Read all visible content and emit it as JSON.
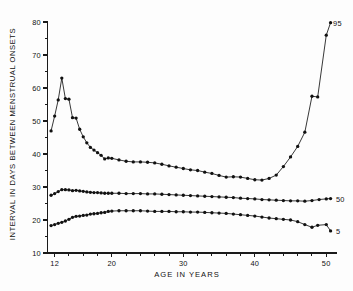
{
  "chart_data": {
    "type": "line",
    "title": "",
    "xlabel": "AGE IN YEARS",
    "ylabel": "INTERVAL IN DAYS BETWEEN MENSTRUAL ONSETS",
    "xlim": [
      11,
      51.5
    ],
    "ylim": [
      10,
      80
    ],
    "grid": false,
    "legend_position": "right-inline",
    "x_ticks_major": [
      12,
      20,
      30,
      40,
      50
    ],
    "x_ticks_major_labels": [
      "12",
      "20",
      "30",
      "40",
      "50"
    ],
    "x_ticks_minor": [
      14,
      16,
      18,
      22,
      24,
      26,
      28,
      32,
      34,
      36,
      38,
      42,
      44,
      46,
      48
    ],
    "y_ticks_major": [
      10,
      20,
      30,
      40,
      50,
      60,
      70,
      80
    ],
    "y_ticks_major_labels": [
      "10",
      "20",
      "30",
      "40",
      "50",
      "60",
      "70",
      "80"
    ],
    "y_ticks_minor": [
      15,
      25,
      35,
      45,
      55,
      65,
      75
    ],
    "series": [
      {
        "name": "95",
        "label": "95",
        "label_x": 50.6,
        "label_y": 79.6,
        "x": [
          11.5,
          12.0,
          12.5,
          13.0,
          13.5,
          14.0,
          14.5,
          15.0,
          15.5,
          16.0,
          16.5,
          17.0,
          17.5,
          18.0,
          18.5,
          19.0,
          19.5,
          20.0,
          21.0,
          22.0,
          23.0,
          24.0,
          25.0,
          26.0,
          27.0,
          28.0,
          29.0,
          30.0,
          31.0,
          32.0,
          33.0,
          34.0,
          35.0,
          36.0,
          37.0,
          38.0,
          39.0,
          40.0,
          41.0,
          42.0,
          43.0,
          44.0,
          45.0,
          46.0,
          47.0,
          48.0,
          48.8,
          50.0,
          50.6
        ],
        "y": [
          47.0,
          51.5,
          56.4,
          63.0,
          56.8,
          56.6,
          51.0,
          50.9,
          47.5,
          45.2,
          43.4,
          42.0,
          41.2,
          40.4,
          39.6,
          38.5,
          38.8,
          38.7,
          38.2,
          37.8,
          37.6,
          37.6,
          37.5,
          37.3,
          36.9,
          36.4,
          36.0,
          35.6,
          35.2,
          35.0,
          34.5,
          34.1,
          33.5,
          33.0,
          33.1,
          33.0,
          32.6,
          32.2,
          32.1,
          32.6,
          33.6,
          36.2,
          39.1,
          42.3,
          46.6,
          57.5,
          57.3,
          76.0,
          79.8
        ]
      },
      {
        "name": "50",
        "label": "50",
        "label_x": 51.0,
        "label_y": 26.3,
        "x": [
          11.5,
          12.0,
          12.5,
          13.0,
          13.5,
          14.0,
          14.5,
          15.0,
          15.5,
          16.0,
          16.5,
          17.0,
          17.5,
          18.0,
          18.5,
          19.0,
          19.5,
          20.0,
          21.0,
          22.0,
          23.0,
          24.0,
          25.0,
          26.0,
          27.0,
          28.0,
          29.0,
          30.0,
          31.0,
          32.0,
          33.0,
          34.0,
          35.0,
          36.0,
          37.0,
          38.0,
          39.0,
          40.0,
          41.0,
          42.0,
          43.0,
          44.0,
          45.0,
          46.0,
          47.0,
          48.0,
          49.0,
          50.0,
          50.6
        ],
        "y": [
          27.5,
          28.0,
          28.6,
          29.2,
          29.2,
          29.1,
          28.9,
          29.0,
          28.8,
          28.7,
          28.5,
          28.4,
          28.3,
          28.3,
          28.2,
          28.1,
          28.1,
          28.1,
          28.1,
          28.0,
          28.0,
          28.0,
          27.9,
          27.9,
          27.8,
          27.7,
          27.6,
          27.5,
          27.4,
          27.3,
          27.2,
          27.1,
          27.0,
          26.9,
          26.8,
          26.6,
          26.5,
          26.4,
          26.2,
          26.1,
          26.0,
          25.9,
          25.8,
          25.8,
          25.7,
          25.9,
          26.2,
          26.4,
          26.5
        ]
      },
      {
        "name": "5",
        "label": "5",
        "label_x": 51.0,
        "label_y": 16.6,
        "x": [
          11.5,
          12.0,
          12.5,
          13.0,
          13.5,
          14.0,
          14.5,
          15.0,
          15.5,
          16.0,
          16.5,
          17.0,
          17.5,
          18.0,
          18.5,
          19.0,
          19.5,
          20.0,
          21.0,
          22.0,
          23.0,
          24.0,
          25.0,
          26.0,
          27.0,
          28.0,
          29.0,
          30.0,
          31.0,
          32.0,
          33.0,
          34.0,
          35.0,
          36.0,
          37.0,
          38.0,
          39.0,
          40.0,
          41.0,
          42.0,
          43.0,
          44.0,
          45.0,
          46.0,
          47.0,
          48.0,
          48.8,
          50.0,
          50.6
        ],
        "y": [
          18.3,
          18.6,
          19.0,
          19.3,
          19.7,
          20.2,
          20.8,
          21.1,
          21.2,
          21.4,
          21.5,
          21.8,
          21.9,
          22.0,
          22.2,
          22.3,
          22.6,
          22.7,
          22.8,
          22.8,
          22.8,
          22.8,
          22.7,
          22.6,
          22.6,
          22.6,
          22.5,
          22.5,
          22.4,
          22.4,
          22.3,
          22.2,
          22.1,
          22.0,
          21.8,
          21.6,
          21.4,
          21.2,
          20.9,
          20.6,
          20.4,
          20.2,
          20.0,
          19.5,
          18.6,
          17.8,
          18.4,
          18.6,
          16.7
        ]
      }
    ]
  },
  "colors": {
    "ink": "#111111",
    "background": "#fdfdfd"
  }
}
